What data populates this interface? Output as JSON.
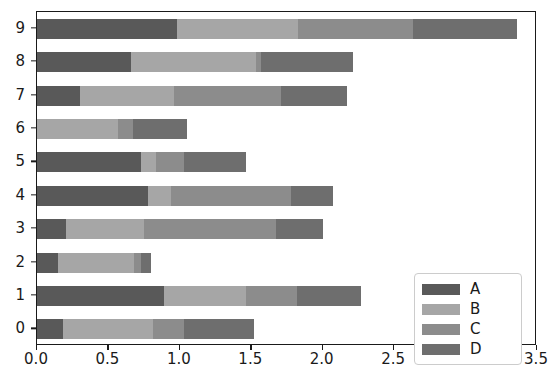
{
  "chart_data": {
    "type": "bar",
    "orientation": "horizontal",
    "stacked": true,
    "title": "",
    "xlabel": "",
    "ylabel": "",
    "xlim": [
      0.0,
      3.5
    ],
    "xticks": [
      0.0,
      0.5,
      1.0,
      1.5,
      2.0,
      2.5,
      3.0,
      3.5
    ],
    "xtick_labels": [
      "0.0",
      "0.5",
      "1.0",
      "1.5",
      "2.0",
      "2.5",
      "3.0",
      "3.5"
    ],
    "categories": [
      "0",
      "1",
      "2",
      "3",
      "4",
      "5",
      "6",
      "7",
      "8",
      "9"
    ],
    "ytick_labels": [
      "0",
      "1",
      "2",
      "3",
      "4",
      "5",
      "6",
      "7",
      "8",
      "9"
    ],
    "grid": false,
    "legend": {
      "position": "lower right",
      "entries": [
        {
          "label": "A",
          "color": "#595959"
        },
        {
          "label": "B",
          "color": "#a6a6a6"
        },
        {
          "label": "C",
          "color": "#8c8c8c"
        },
        {
          "label": "D",
          "color": "#6e6e6e"
        }
      ]
    },
    "series": [
      {
        "name": "A",
        "color": "#595959",
        "values": [
          0.18,
          0.89,
          0.15,
          0.2,
          0.78,
          0.73,
          0.0,
          0.3,
          0.66,
          0.98
        ]
      },
      {
        "name": "B",
        "color": "#a6a6a6",
        "values": [
          0.63,
          0.57,
          0.53,
          0.55,
          0.16,
          0.1,
          0.57,
          0.66,
          0.87,
          0.85
        ]
      },
      {
        "name": "C",
        "color": "#8c8c8c",
        "values": [
          0.22,
          0.36,
          0.05,
          0.92,
          0.84,
          0.2,
          0.1,
          0.75,
          0.04,
          0.8
        ]
      },
      {
        "name": "D",
        "color": "#6e6e6e",
        "values": [
          0.49,
          0.45,
          0.07,
          0.33,
          0.29,
          0.43,
          0.38,
          0.46,
          0.64,
          0.73
        ]
      }
    ],
    "totals": [
      1.52,
      2.27,
      0.8,
      2.0,
      2.07,
      1.46,
      1.05,
      2.17,
      2.21,
      3.36
    ]
  }
}
